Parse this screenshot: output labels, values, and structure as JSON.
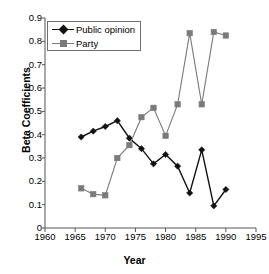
{
  "chart_data": {
    "type": "line",
    "title": "",
    "xlabel": "Year",
    "ylabel": "Beta Coefficients",
    "xlim": [
      1960,
      1995
    ],
    "ylim": [
      0,
      0.9
    ],
    "xticks": [
      "1960",
      "1965",
      "1970",
      "1975",
      "1980",
      "1985",
      "1990",
      "1995"
    ],
    "yticks": [
      "0",
      "0.1",
      "0.2",
      "0.3",
      "0.4",
      "0.5",
      "0.6",
      "0.7",
      "0.8",
      "0.9"
    ],
    "grid": false,
    "legend_position": "upper-left-inside",
    "x": [
      1966,
      1968,
      1970,
      1972,
      1974,
      1976,
      1978,
      1980,
      1982,
      1984,
      1986,
      1988,
      1990
    ],
    "series": [
      {
        "name": "Public opinion",
        "marker": "diamond",
        "color": "#111111",
        "values": [
          0.39,
          0.415,
          0.435,
          0.46,
          0.385,
          0.34,
          0.275,
          0.315,
          0.265,
          0.15,
          0.335,
          0.095,
          0.165
        ]
      },
      {
        "name": "Party",
        "marker": "square",
        "color": "#7a7a7a",
        "values": [
          0.17,
          0.145,
          0.14,
          0.3,
          0.355,
          0.475,
          0.515,
          0.395,
          0.53,
          0.835,
          0.53,
          0.84,
          0.825
        ]
      }
    ]
  },
  "axis": {
    "x_title": "Year",
    "y_title": "Beta Coefficients"
  },
  "legend": {
    "items": [
      {
        "label": "Public opinion"
      },
      {
        "label": "Party"
      }
    ]
  },
  "colors": {
    "public_opinion": "#111111",
    "party": "#7a7a7a",
    "axis": "#555555",
    "background": "#ffffff"
  }
}
